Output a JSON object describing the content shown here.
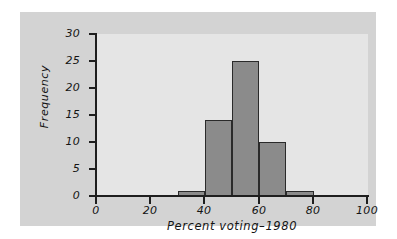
{
  "chart_data": {
    "type": "bar",
    "title": "",
    "subtitle": "",
    "xlabel": "Percent voting–1980",
    "ylabel": "Frequency",
    "categories": [
      "30–40",
      "40–50",
      "50–60",
      "60–70",
      "70–80"
    ],
    "bin_edges": [
      30,
      40,
      50,
      60,
      70,
      80
    ],
    "values": [
      1,
      14,
      25,
      10,
      1
    ],
    "bin_width": 10,
    "xlim": [
      0,
      100
    ],
    "ylim": [
      0,
      30
    ],
    "xticks": [
      0,
      20,
      40,
      60,
      80,
      100
    ],
    "yticks": [
      0,
      5,
      10,
      15,
      20,
      25,
      30
    ],
    "xtick_labels": [
      "0",
      "20",
      "40",
      "60",
      "80",
      "100"
    ],
    "ytick_labels": [
      "0",
      "5",
      "10",
      "15",
      "20",
      "25",
      "30"
    ],
    "grid": false,
    "legend": false,
    "legend_position": "none",
    "annotations": []
  },
  "style": {
    "figure_background": "#d3d3d3",
    "plot_background": "#e5e5e5",
    "page_background": "#ffffff",
    "bar_fill": "#8b8b8b",
    "bar_edge": "#2a2a2a",
    "axis_color": "#1e1e1e",
    "text_color": "#141414"
  }
}
